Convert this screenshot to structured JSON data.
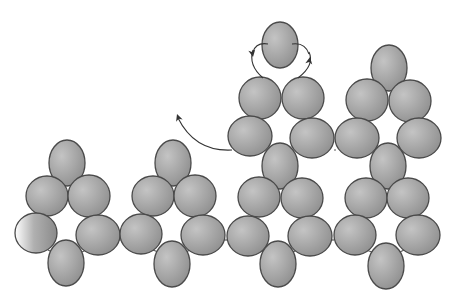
{
  "diagram": {
    "title": "Bead weaving pattern diagram",
    "colors": {
      "background": "#ffffff",
      "bead_fill_light": "#c4c4c4",
      "bead_fill_dark": "#8a8a8a",
      "bead_outline": "#4a4a4a",
      "thread": "#5a5a5a",
      "arrow": "#333333"
    },
    "bead_size": {
      "rx": 20,
      "ry": 20
    },
    "clusters": [
      {
        "name": "cluster-1",
        "beads": [
          {
            "cx": 67,
            "cy": 163,
            "rx": 18,
            "ry": 23
          },
          {
            "cx": 47,
            "cy": 196,
            "rx": 21,
            "ry": 20
          },
          {
            "cx": 89,
            "cy": 196,
            "rx": 21,
            "ry": 21
          },
          {
            "cx": 36,
            "cy": 233,
            "rx": 21,
            "ry": 20
          },
          {
            "cx": 98,
            "cy": 235,
            "rx": 22,
            "ry": 20
          },
          {
            "cx": 66,
            "cy": 263,
            "rx": 18,
            "ry": 23
          }
        ]
      },
      {
        "name": "cluster-2",
        "beads": [
          {
            "cx": 173,
            "cy": 163,
            "rx": 18,
            "ry": 23
          },
          {
            "cx": 153,
            "cy": 196,
            "rx": 21,
            "ry": 20
          },
          {
            "cx": 195,
            "cy": 196,
            "rx": 21,
            "ry": 21
          },
          {
            "cx": 141,
            "cy": 234,
            "rx": 21,
            "ry": 20
          },
          {
            "cx": 203,
            "cy": 235,
            "rx": 22,
            "ry": 20
          },
          {
            "cx": 172,
            "cy": 264,
            "rx": 18,
            "ry": 23
          }
        ]
      },
      {
        "name": "cluster-3",
        "beads": [
          {
            "cx": 280,
            "cy": 45,
            "rx": 18,
            "ry": 23
          },
          {
            "cx": 260,
            "cy": 98,
            "rx": 21,
            "ry": 21
          },
          {
            "cx": 303,
            "cy": 98,
            "rx": 21,
            "ry": 21
          },
          {
            "cx": 250,
            "cy": 136,
            "rx": 22,
            "ry": 20
          },
          {
            "cx": 312,
            "cy": 138,
            "rx": 22,
            "ry": 20
          },
          {
            "cx": 280,
            "cy": 166,
            "rx": 18,
            "ry": 23
          },
          {
            "cx": 259,
            "cy": 197,
            "rx": 21,
            "ry": 20
          },
          {
            "cx": 302,
            "cy": 198,
            "rx": 21,
            "ry": 20
          },
          {
            "cx": 248,
            "cy": 236,
            "rx": 21,
            "ry": 20
          },
          {
            "cx": 310,
            "cy": 236,
            "rx": 22,
            "ry": 20
          },
          {
            "cx": 278,
            "cy": 264,
            "rx": 18,
            "ry": 23
          }
        ]
      },
      {
        "name": "cluster-4",
        "beads": [
          {
            "cx": 389,
            "cy": 68,
            "rx": 18,
            "ry": 23
          },
          {
            "cx": 367,
            "cy": 100,
            "rx": 21,
            "ry": 21
          },
          {
            "cx": 410,
            "cy": 101,
            "rx": 21,
            "ry": 21
          },
          {
            "cx": 357,
            "cy": 138,
            "rx": 22,
            "ry": 20
          },
          {
            "cx": 419,
            "cy": 138,
            "rx": 22,
            "ry": 20
          },
          {
            "cx": 388,
            "cy": 166,
            "rx": 18,
            "ry": 23
          },
          {
            "cx": 366,
            "cy": 198,
            "rx": 21,
            "ry": 20
          },
          {
            "cx": 408,
            "cy": 198,
            "rx": 21,
            "ry": 20
          },
          {
            "cx": 355,
            "cy": 235,
            "rx": 21,
            "ry": 20
          },
          {
            "cx": 418,
            "cy": 235,
            "rx": 22,
            "ry": 20
          },
          {
            "cx": 386,
            "cy": 266,
            "rx": 18,
            "ry": 23
          }
        ]
      }
    ],
    "threads": [
      "M 56 245 L 78 248",
      "M 119 240 L 121 240",
      "M 224 240 L 227 240",
      "M 331 240 L 334 240",
      "M 48 250 L 52 252",
      "M 86 250 L 82 252",
      "M 153 250 L 158 252",
      "M 190 250 L 186 252",
      "M 259 250 L 264 252",
      "M 297 250 L 293 252",
      "M 366 250 L 372 252",
      "M 404 250 L 400 252",
      "M 334 150 L 336 150"
    ],
    "arrows": [
      {
        "name": "arrow-left-thread-path",
        "path": "M 232 150 Q 195 152 178 118",
        "head": {
          "x": 177,
          "y": 114,
          "angle": -110
        }
      },
      {
        "name": "arrow-top-left-loop",
        "path": "M 263 78 Q 248 65 253 50",
        "head": {
          "x": 253,
          "y": 57,
          "angle": 80
        }
      },
      {
        "name": "arrow-top-right-loop",
        "path": "M 298 78 Q 315 65 309 52",
        "head": {
          "x": 310,
          "y": 57,
          "angle": -80
        }
      }
    ],
    "top_loop_thread": "M 253 52 Q 256 42 268 44 M 292 44 Q 305 42 309 54"
  }
}
